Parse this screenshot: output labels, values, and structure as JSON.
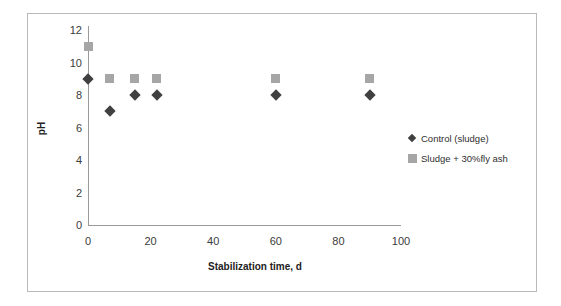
{
  "chart_data": {
    "type": "scatter",
    "title": "",
    "xlabel": "Stabilization time, d",
    "ylabel": "pH",
    "xlim": [
      0,
      100
    ],
    "ylim": [
      0,
      12
    ],
    "xticks": [
      0,
      20,
      40,
      60,
      80,
      100
    ],
    "yticks": [
      0,
      2,
      4,
      6,
      8,
      10,
      12
    ],
    "grid": false,
    "legend_position": "right",
    "series": [
      {
        "name": "Control (sludge)",
        "marker": "diamond",
        "color": "#404040",
        "x": [
          0,
          7,
          15,
          22,
          60,
          90
        ],
        "y": [
          9,
          7,
          8,
          8,
          8,
          8
        ]
      },
      {
        "name": "Sludge + 30%fly ash",
        "marker": "square",
        "color": "#a6a6a6",
        "x": [
          0,
          7,
          15,
          22,
          60,
          90
        ],
        "y": [
          11,
          9,
          9,
          9,
          9,
          9
        ]
      }
    ]
  },
  "axes": {
    "x_title": "Stabilization time, d",
    "y_title": "pH",
    "x_tick_labels": [
      "0",
      "20",
      "40",
      "60",
      "80",
      "100"
    ],
    "y_tick_labels": [
      "0",
      "2",
      "4",
      "6",
      "8",
      "10",
      "12"
    ]
  },
  "legend": {
    "entries": [
      {
        "label": "Control (sludge)",
        "marker": "diamond",
        "color": "#404040"
      },
      {
        "label": "Sludge + 30%fly ash",
        "marker": "square",
        "color": "#a6a6a6"
      }
    ]
  },
  "colors": {
    "series_control": "#404040",
    "series_flyash": "#a6a6a6",
    "axis_line": "#9a9a9a",
    "frame_border": "#b9b9b9",
    "background": "#ffffff",
    "tick_text": "#3b3b3b"
  }
}
